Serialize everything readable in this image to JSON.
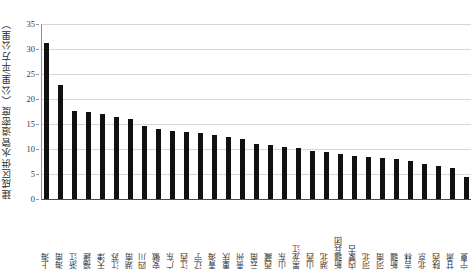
{
  "chart_data": {
    "type": "bar",
    "title": "",
    "xlabel": "",
    "ylabel": "建成区供水管道密度（公里/平方公里）",
    "ylim": [
      0,
      35
    ],
    "yticks": [
      0,
      5,
      10,
      15,
      20,
      25,
      30,
      35
    ],
    "grid": true,
    "legend": "none",
    "bar_color": "#111111",
    "categories": [
      "上海",
      "海南",
      "浙江",
      "福建",
      "天津",
      "江苏",
      "湖南",
      "四川",
      "安徽",
      "广东",
      "江西",
      "辽宁",
      "青海",
      "重庆",
      "贵州",
      "云南",
      "西藏",
      "山东",
      "黑龙江",
      "山西",
      "湖北",
      "新疆兵团",
      "内蒙古",
      "河北",
      "河南",
      "新疆",
      "吉林",
      "北京",
      "陕西",
      "甘肃",
      "宁夏"
    ],
    "values": [
      31.3,
      22.9,
      17.6,
      17.5,
      17.1,
      16.5,
      16.1,
      14.6,
      14.1,
      13.6,
      13.4,
      13.2,
      12.9,
      12.4,
      12.1,
      11.1,
      10.9,
      10.4,
      10.2,
      9.6,
      9.4,
      9.0,
      8.6,
      8.5,
      8.3,
      8.0,
      7.6,
      7.0,
      6.6,
      6.2,
      4.5
    ]
  }
}
